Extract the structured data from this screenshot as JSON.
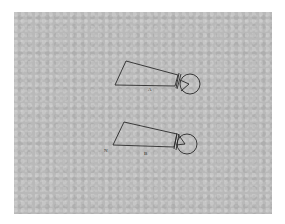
{
  "diagram": {
    "background_color": "#b9b9b9",
    "stroke_color": "#2a2a2a",
    "figures": [
      {
        "id": "A",
        "label": "A"
      },
      {
        "id": "B",
        "label": "B"
      }
    ],
    "side_mark": "N"
  }
}
